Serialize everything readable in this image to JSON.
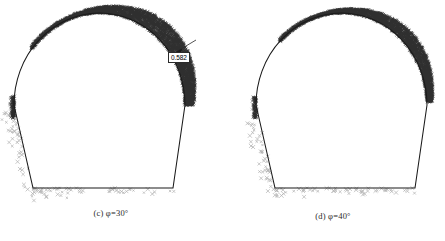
{
  "figure": {
    "kind": "two-panel scatter figure of tunnel plastic zones",
    "background_color": "#ffffff",
    "outline_color": "#1a1a1a",
    "plastic_zone_color": "#1a1a1a",
    "scatter_marker_color": "#b0b0b0",
    "callout_border_color": "#2b2b2b"
  },
  "panels": [
    {
      "id": "c",
      "caption_index": "(c)",
      "caption_symbol": "φ",
      "caption_equals": "=",
      "caption_value": "30°",
      "caption_full": "(c)  φ=30°",
      "callout_value": "0.582",
      "callout_name": "max-plastic-zone-depth-label"
    },
    {
      "id": "d",
      "caption_index": "(d)",
      "caption_symbol": "φ",
      "caption_equals": "=",
      "caption_value": "40°",
      "caption_full": "(d)  φ=40°",
      "callout_value": "0.425",
      "callout_name": "max-plastic-zone-depth-label"
    }
  ],
  "chart_data": {
    "type": "scatter",
    "title": "",
    "xlabel": "",
    "ylabel": "",
    "grid": false,
    "legend": null,
    "panels": [
      {
        "name": "(c) φ=30°",
        "friction_angle_deg": 30,
        "max_plastic_zone_depth": 0.582,
        "annotations": [
          {
            "text": "0.582",
            "target": "upper-right arch shoulder",
            "leader": "arrow"
          }
        ],
        "tunnel_outline": {
          "shape": "horseshoe",
          "crown_apex": [
            99.5,
            13
          ],
          "arch_springline_y": 105,
          "arch_left_x": 14,
          "arch_right_x": 185,
          "floor_y": 188,
          "floor_left_x": 33,
          "floor_right_x": 173
        },
        "plastic_zone": {
          "description": "dense dark band along crown and upper-right arch, thickest at right shoulder",
          "extent_deg": [
            -10,
            140
          ],
          "max_thickness_px": 17,
          "density": "high"
        },
        "scatter_markers": {
          "glyph": "×",
          "color": "#b0b0b0",
          "regions": [
            "below left wall",
            "beneath floor"
          ],
          "count_approx": 70
        }
      },
      {
        "name": "(d) φ=40°",
        "friction_angle_deg": 40,
        "max_plastic_zone_depth": 0.425,
        "annotations": [
          {
            "text": "0.425",
            "target": "upper-right arch shoulder",
            "leader": "none"
          }
        ],
        "tunnel_outline": {
          "shape": "horseshoe",
          "crown_apex": [
            99.5,
            13
          ],
          "arch_springline_y": 105,
          "arch_left_x": 14,
          "arch_right_x": 185,
          "floor_y": 188,
          "floor_left_x": 33,
          "floor_right_x": 173
        },
        "plastic_zone": {
          "description": "narrower dark band along crown and upper-right arch",
          "extent_deg": [
            0,
            135
          ],
          "max_thickness_px": 12,
          "density": "high"
        },
        "scatter_markers": {
          "glyph": "×",
          "color": "#b0b0b0",
          "regions": [
            "below left wall",
            "beneath floor"
          ],
          "count_approx": 70
        }
      }
    ]
  }
}
